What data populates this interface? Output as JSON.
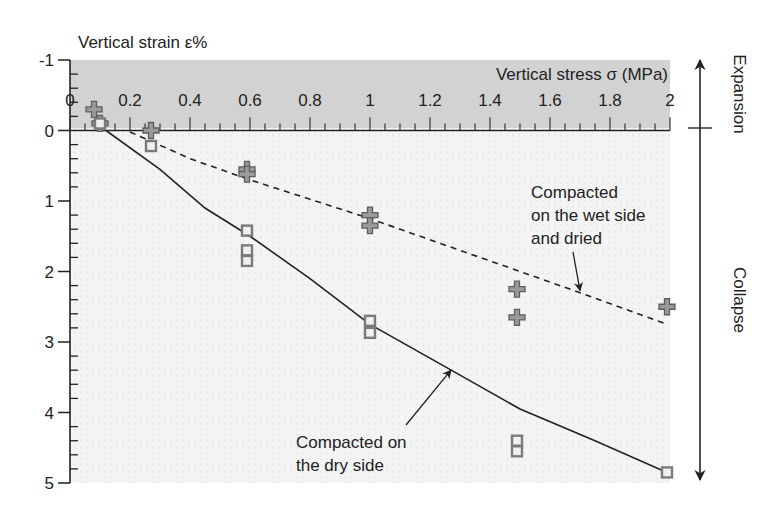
{
  "chart_data": {
    "type": "scatter",
    "title": "",
    "xlabel": "Vertical stress σ (MPa)",
    "ylabel": "Vertical strain ε%",
    "xlim": [
      0,
      2
    ],
    "ylim": [
      -1,
      5
    ],
    "y_inverted": true,
    "x_axis_position": "top (at strain 0)",
    "x_ticks": [
      "0",
      "0.2",
      "0.4",
      "0.6",
      "0.8",
      "1",
      "1.2",
      "1.4",
      "1.6",
      "1.8",
      "2"
    ],
    "y_ticks": [
      "-1",
      "0",
      "1",
      "2",
      "3",
      "4",
      "5"
    ],
    "grid": false,
    "shaded_region": {
      "y_from": -1,
      "y_to": 0,
      "meaning": "expansion zone"
    },
    "side_annotations": {
      "expansion": "Expansion",
      "collapse": "Collapse"
    },
    "series": [
      {
        "name": "Compacted on the wet side and dried",
        "marker": "cross",
        "points": [
          {
            "x": 0.08,
            "y": -0.3
          },
          {
            "x": 0.1,
            "y": -0.1
          },
          {
            "x": 0.27,
            "y": 0.0
          },
          {
            "x": 0.59,
            "y": 0.55
          },
          {
            "x": 0.59,
            "y": 0.62
          },
          {
            "x": 1.0,
            "y": 1.2
          },
          {
            "x": 1.0,
            "y": 1.35
          },
          {
            "x": 1.49,
            "y": 2.25
          },
          {
            "x": 1.49,
            "y": 2.65
          },
          {
            "x": 1.99,
            "y": 2.5
          }
        ],
        "trend_line": {
          "style": "dashed",
          "points": [
            {
              "x": 0.2,
              "y": 0.02
            },
            {
              "x": 0.4,
              "y": 0.4
            },
            {
              "x": 0.6,
              "y": 0.7
            },
            {
              "x": 1.0,
              "y": 1.25
            },
            {
              "x": 1.4,
              "y": 1.85
            },
            {
              "x": 1.7,
              "y": 2.3
            },
            {
              "x": 1.99,
              "y": 2.75
            }
          ]
        }
      },
      {
        "name": "Compacted on the dry side",
        "marker": "square",
        "points": [
          {
            "x": 0.1,
            "y": -0.1
          },
          {
            "x": 0.27,
            "y": 0.22
          },
          {
            "x": 0.59,
            "y": 1.42
          },
          {
            "x": 0.59,
            "y": 1.7
          },
          {
            "x": 0.59,
            "y": 1.85
          },
          {
            "x": 1.0,
            "y": 2.7
          },
          {
            "x": 1.0,
            "y": 2.87
          },
          {
            "x": 1.49,
            "y": 4.4
          },
          {
            "x": 1.49,
            "y": 4.55
          },
          {
            "x": 1.99,
            "y": 4.85
          }
        ],
        "trend_line": {
          "style": "solid",
          "points": [
            {
              "x": 0.12,
              "y": 0.0
            },
            {
              "x": 0.3,
              "y": 0.55
            },
            {
              "x": 0.45,
              "y": 1.1
            },
            {
              "x": 0.6,
              "y": 1.5
            },
            {
              "x": 0.8,
              "y": 2.1
            },
            {
              "x": 1.0,
              "y": 2.75
            },
            {
              "x": 1.25,
              "y": 3.35
            },
            {
              "x": 1.5,
              "y": 3.95
            },
            {
              "x": 1.75,
              "y": 4.4
            },
            {
              "x": 1.99,
              "y": 4.85
            }
          ]
        }
      }
    ],
    "annotations": [
      {
        "text": [
          "Compacted",
          "on the wet side",
          "and dried"
        ],
        "arrow_to": {
          "x": 1.7,
          "y": 2.3
        }
      },
      {
        "text": [
          "Compacted on",
          "the dry side"
        ],
        "arrow_to": {
          "x": 1.27,
          "y": 3.4
        }
      }
    ]
  }
}
